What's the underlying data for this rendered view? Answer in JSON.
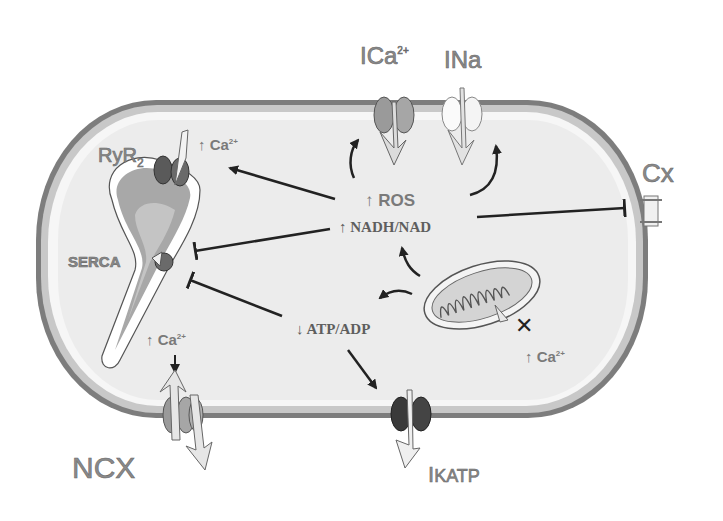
{
  "diagram": {
    "type": "cell-signaling-schematic",
    "colors": {
      "membrane": "#7a7a7a",
      "cytoplasm": "#ededed",
      "cytoplasm_inner": "#e4e4e4",
      "label_gray": "#8a8a8a",
      "arrow": "#222222",
      "channel_dark": "#3a3a3a",
      "channel_mid": "#9a9a9a",
      "channel_light": "#f4f4f4"
    },
    "channels": {
      "ica": {
        "prefix": "I",
        "label": "Ca",
        "superscript": "2+"
      },
      "ina": {
        "prefix": "I",
        "label": "Na"
      },
      "cx": {
        "label": "Cx"
      },
      "ncx": {
        "label": "NCX"
      },
      "ikatp": {
        "prefix": "I",
        "label": "KATP"
      }
    },
    "organelles": {
      "ryr2": {
        "label": "RyR",
        "subscript": "2"
      },
      "serca": {
        "label": "SERCA"
      },
      "mitochondrion": {
        "label": "mitochondrion"
      }
    },
    "mediators": {
      "ros": {
        "arrow": "↑",
        "label": "ROS"
      },
      "nadh": {
        "arrow": "↑",
        "label": "NADH/NAD"
      },
      "atp": {
        "arrow": "↓",
        "label": "ATP/ADP"
      }
    },
    "calcium_labels": {
      "sr_release": {
        "arrow": "↑",
        "label": "Ca",
        "superscript": "2+"
      },
      "cytosolic": {
        "arrow": "↑",
        "label": "Ca",
        "superscript": "2+"
      },
      "mito": {
        "arrow": "↑",
        "label": "Ca",
        "superscript": "2+"
      }
    }
  }
}
